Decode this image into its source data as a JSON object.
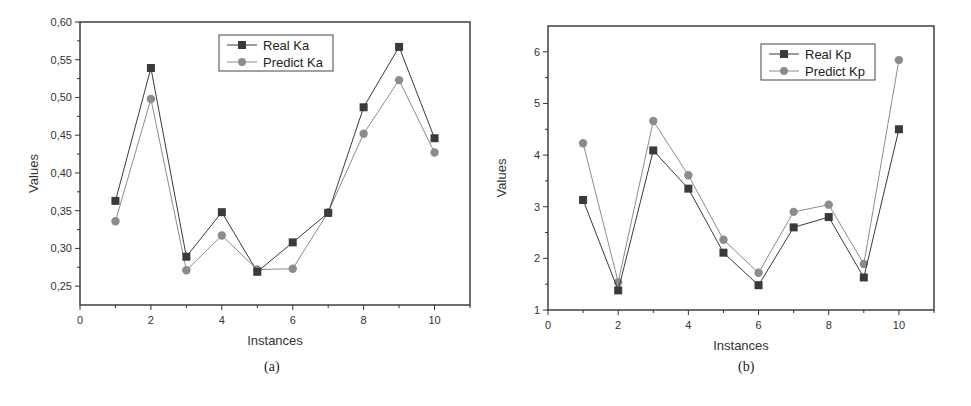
{
  "chart_data": [
    {
      "id": "a",
      "type": "line",
      "caption": "(a)",
      "title": "",
      "xlabel": "Instances",
      "ylabel": "Values",
      "xlim": [
        0,
        11
      ],
      "ylim": [
        0.225,
        0.6
      ],
      "xticks": [
        0,
        2,
        4,
        6,
        8,
        10
      ],
      "yticks": [
        "0,25",
        "0,30",
        "0,35",
        "0,40",
        "0,45",
        "0,50",
        "0,55",
        "0,60"
      ],
      "ytick_values": [
        0.25,
        0.3,
        0.35,
        0.4,
        0.45,
        0.5,
        0.55,
        0.6
      ],
      "grid": false,
      "legend_position": "upper center",
      "x": [
        1,
        2,
        3,
        4,
        5,
        6,
        7,
        8,
        9,
        10
      ],
      "series": [
        {
          "name": "Real Ka",
          "marker": "square",
          "color": "#3a3a3a",
          "values": [
            0.363,
            0.539,
            0.289,
            0.348,
            0.269,
            0.308,
            0.347,
            0.487,
            0.567,
            0.446
          ]
        },
        {
          "name": "Predict Ka",
          "marker": "circle",
          "color": "#8c8c8c",
          "values": [
            0.336,
            0.498,
            0.271,
            0.317,
            0.272,
            0.273,
            0.348,
            0.452,
            0.523,
            0.427
          ]
        }
      ]
    },
    {
      "id": "b",
      "type": "line",
      "caption": "(b)",
      "title": "",
      "xlabel": "Instances",
      "ylabel": "Values",
      "xlim": [
        0,
        11
      ],
      "ylim": [
        1,
        6.5
      ],
      "xticks": [
        0,
        2,
        4,
        6,
        8,
        10
      ],
      "yticks": [
        "1",
        "2",
        "3",
        "4",
        "5",
        "6"
      ],
      "ytick_values": [
        1,
        2,
        3,
        4,
        5,
        6
      ],
      "grid": false,
      "legend_position": "upper right",
      "x": [
        1,
        2,
        3,
        4,
        5,
        6,
        7,
        8,
        9,
        10
      ],
      "series": [
        {
          "name": "Real Kp",
          "marker": "square",
          "color": "#3a3a3a",
          "values": [
            3.13,
            1.38,
            4.09,
            3.35,
            2.11,
            1.48,
            2.6,
            2.8,
            1.63,
            4.5
          ]
        },
        {
          "name": "Predict Kp",
          "marker": "circle",
          "color": "#8c8c8c",
          "values": [
            4.23,
            1.54,
            4.66,
            3.61,
            2.36,
            1.72,
            2.9,
            3.04,
            1.89,
            5.84
          ]
        }
      ]
    }
  ],
  "captions": {
    "a": "(a)",
    "b": "(b)"
  }
}
